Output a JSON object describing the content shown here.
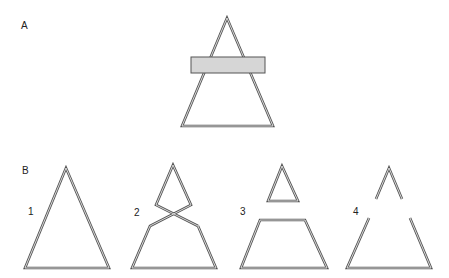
{
  "panels": {
    "A": {
      "label": "A",
      "description": "Triangle partially occluded by a gray horizontal bar",
      "triangle": {
        "apex": [
          227,
          18
        ],
        "bottom_left": [
          182,
          126
        ],
        "bottom_right": [
          273,
          126
        ]
      },
      "occluder": {
        "x": 191,
        "y": 57,
        "width": 74,
        "height": 16,
        "fill": "#d6d6d6",
        "stroke": "#555555"
      }
    },
    "B": {
      "label": "B",
      "figures": [
        {
          "number": "1",
          "description": "Complete triangle"
        },
        {
          "number": "2",
          "description": "Figure with crossing lines forming upper diamond and lower trapezoid"
        },
        {
          "number": "3",
          "description": "Small triangle above a trapezoid"
        },
        {
          "number": "4",
          "description": "Triangle with gaps in both sides"
        }
      ]
    }
  },
  "colors": {
    "line": "#555555",
    "line_inner": "#e6e6e6",
    "occluder": "#d6d6d6",
    "background": "#ffffff"
  }
}
